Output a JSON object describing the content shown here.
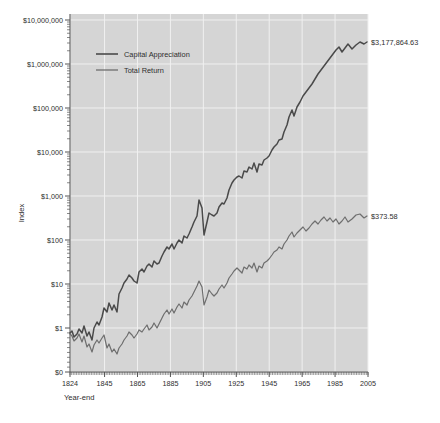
{
  "chart_data": {
    "type": "line",
    "title": "",
    "subtitle": "",
    "xlabel": "Year-end",
    "ylabel": "Index",
    "yscale": "log",
    "grid": true,
    "legend_position": "top-left",
    "xlim": [
      1824,
      2005
    ],
    "ylim_labels": [
      "$0",
      "$1",
      "$10",
      "$100",
      "$1,000",
      "$10,000",
      "$100,000",
      "$1,000,000",
      "$10,000,000"
    ],
    "ytick_labels": [
      "$10,000,000",
      "$1,000,000",
      "$100,000",
      "$10,000",
      "$1,000",
      "$100",
      "$10",
      "$1",
      "$0"
    ],
    "ytick_values": [
      10000000,
      1000000,
      100000,
      10000,
      1000,
      100,
      10,
      1,
      0
    ],
    "xtick_labels": [
      "1824",
      "1845",
      "1865",
      "1885",
      "1905",
      "1925",
      "1945",
      "1965",
      "1985",
      "2005"
    ],
    "xtick_values": [
      1824,
      1845,
      1865,
      1885,
      1905,
      1925,
      1945,
      1965,
      1985,
      2005
    ],
    "annotations": [
      {
        "name": "capital-appreciation-end-value",
        "text": "$3,177,864.63",
        "x": 2005,
        "y": 3177864.63
      },
      {
        "name": "total-return-end-value",
        "text": "$373.58",
        "x": 2005,
        "y": 373.58
      }
    ],
    "series": [
      {
        "name": "Capital Appreciation",
        "color": "#4a4a4a",
        "width": 1.5,
        "x": [
          1824,
          1826,
          1828,
          1830,
          1832,
          1834,
          1836,
          1838,
          1840,
          1842,
          1844,
          1846,
          1848,
          1850,
          1852,
          1854,
          1856,
          1858,
          1860,
          1862,
          1864,
          1866,
          1868,
          1870,
          1872,
          1874,
          1876,
          1878,
          1880,
          1882,
          1884,
          1886,
          1888,
          1890,
          1892,
          1894,
          1896,
          1898,
          1900,
          1902,
          1904,
          1906,
          1908,
          1910,
          1912,
          1914,
          1916,
          1918,
          1920,
          1922,
          1924,
          1926,
          1928,
          1930,
          1932,
          1934,
          1936,
          1938,
          1940,
          1942,
          1944,
          1946,
          1948,
          1950,
          1952,
          1954,
          1956,
          1958,
          1960,
          1962,
          1964,
          1966,
          1968,
          1970,
          1972,
          1974,
          1976,
          1978,
          1980,
          1982,
          1984,
          1986,
          1988,
          1990,
          1992,
          1994,
          1996,
          1998,
          2000,
          2002,
          2004,
          2005
        ],
        "y": [
          1.0,
          1.05,
          0.97,
          1.02,
          1.12,
          1.05,
          1.18,
          0.98,
          1.05,
          0.92,
          1.15,
          1.3,
          1.22,
          1.45,
          1.75,
          1.62,
          1.95,
          1.7,
          1.88,
          1.65,
          2.35,
          2.8,
          3.2,
          3.6,
          4.1,
          3.8,
          3.55,
          3.4,
          4.6,
          5.1,
          4.7,
          5.6,
          5.9,
          5.5,
          6.4,
          6.0,
          6.1,
          7.4,
          8.2,
          9.6,
          9.1,
          10.5,
          9.0,
          10.8,
          11.9,
          10.9,
          13.5,
          12.8,
          14.5,
          18.5,
          22.0,
          27.0,
          46.0,
          35.0,
          16.0,
          24.0,
          33.0,
          30.0,
          29.0,
          32.0,
          40.0,
          46.0,
          44.0,
          55.0,
          70.0,
          92.0,
          105.0,
          118.0,
          122.0,
          112.0,
          152.0,
          148.0,
          178.0,
          165.0,
          215.0,
          145.0,
          205.0,
          195.0,
          250.0,
          270.0,
          295.0,
          400.0,
          450.0,
          520.0,
          620.0,
          660.0,
          920.0,
          1350.0,
          2100.0,
          1550.0,
          2350.0,
          3177864.63
        ]
      },
      {
        "name": "Total Return",
        "color": "#6e6e6e",
        "width": 1.2,
        "x": [
          1824,
          1826,
          1828,
          1830,
          1832,
          1834,
          1836,
          1838,
          1840,
          1842,
          1844,
          1846,
          1848,
          1850,
          1852,
          1854,
          1856,
          1858,
          1860,
          1862,
          1864,
          1866,
          1868,
          1870,
          1872,
          1874,
          1876,
          1878,
          1880,
          1882,
          1884,
          1886,
          1888,
          1890,
          1892,
          1894,
          1896,
          1898,
          1900,
          1902,
          1904,
          1906,
          1908,
          1910,
          1912,
          1914,
          1916,
          1918,
          1920,
          1922,
          1924,
          1926,
          1928,
          1930,
          1932,
          1934,
          1936,
          1938,
          1940,
          1942,
          1944,
          1946,
          1948,
          1950,
          1952,
          1954,
          1956,
          1958,
          1960,
          1962,
          1964,
          1966,
          1968,
          1970,
          1972,
          1974,
          1976,
          1978,
          1980,
          1982,
          1984,
          1986,
          1988,
          1990,
          1992,
          1994,
          1996,
          1998,
          2000,
          2002,
          2004,
          2005
        ],
        "y": [
          1.0,
          1.04,
          0.95,
          1.0,
          1.1,
          1.02,
          1.15,
          0.95,
          1.0,
          0.9,
          1.12,
          1.28,
          1.2,
          1.4,
          1.7,
          1.58,
          1.9,
          1.68,
          1.85,
          1.62,
          2.3,
          2.75,
          3.15,
          3.55,
          4.0,
          3.75,
          3.5,
          3.35,
          4.55,
          5.05,
          4.65,
          5.55,
          5.85,
          5.45,
          6.35,
          5.95,
          6.05,
          7.35,
          8.1,
          9.5,
          9.0,
          10.4,
          8.9,
          10.7,
          11.8,
          10.8,
          13.4,
          12.7,
          14.4,
          18.4,
          21.8,
          26.8,
          45.5,
          34.5,
          15.8,
          23.8,
          32.5,
          29.5,
          28.5,
          31.5,
          39.5,
          45.5,
          43.5,
          54.0,
          69.0,
          91.0,
          104.0,
          117.0,
          121.0,
          111.0,
          151.0,
          147.0,
          177.0,
          164.0,
          214.0,
          144.0,
          204.0,
          194.0,
          249.0,
          269.0,
          294.0,
          373.58,
          373.58,
          373.58,
          373.58,
          373.58,
          373.58,
          373.58,
          373.58,
          373.58,
          373.58,
          373.58
        ]
      }
    ],
    "capital_appreciation_path": "M 70,333 L 72,331 L 74,337 L 77,334 L 79,329 L 82,333 L 84,326 L 87,336 L 89,332 L 92,340 L 94,328 L 97,322 L 99,325 L 102,317 L 104,308 L 107,312 L 109,303 L 112,310 L 114,305 L 117,312 L 119,294 L 122,288 L 124,283 L 127,279 L 129,275 L 132,278 L 134,281 L 137,283 L 139,272 L 142,269 L 144,272 L 147,266 L 149,264 L 152,267 L 154,261 L 157,264 L 159,263 L 162,256 L 164,252 L 167,247 L 169,249 L 172,244 L 174,249 L 177,243 L 179,240 L 182,243 L 184,236 L 187,238 L 189,234 L 192,227 L 194,222 L 197,216 L 199,200 L 202,208 L 204,235 L 207,222 L 209,213 L 212,215 L 214,216 L 217,213 L 219,207 L 222,203 L 224,204 L 227,198 L 229,190 L 232,183 L 234,180 L 237,177 L 239,176 L 242,178 L 244,171 L 247,172 L 249,167 L 252,169 L 254,163 L 257,172 L 259,164 L 262,165 L 264,160 L 267,158 L 269,156 L 272,150 L 274,147 L 277,144 L 279,140 L 282,139 L 284,132 L 287,125 L 289,117 L 292,110 L 294,116 L 297,107 L 300,102 L 303,96 L 306,92 L 309,88 L 312,84 L 315,79 L 318,74 L 321,70 L 324,66 L 327,62 L 330,58 L 333,54 L 336,50 L 339,47 L 342,52 L 345,48 L 348,44 L 352,49 L 356,45 L 360,42 L 364,44 L 367,42",
    "total_return_path": "M 70,334 L 72,336 L 74,341 L 77,338 L 79,334 L 82,342 L 84,336 L 87,347 L 89,344 L 92,352 L 94,345 L 97,340 L 99,343 L 102,338 L 104,335 L 107,348 L 109,344 L 112,352 L 114,349 L 117,354 L 119,348 L 122,344 L 124,340 L 127,336 L 129,332 L 132,335 L 134,338 L 137,334 L 139,330 L 142,332 L 144,329 L 147,325 L 149,330 L 152,327 L 154,323 L 157,328 L 159,324 L 162,318 L 164,314 L 167,310 L 169,314 L 172,309 L 174,313 L 177,307 L 179,304 L 182,308 L 184,302 L 187,305 L 189,300 L 192,296 L 194,292 L 197,286 L 199,281 L 202,287 L 204,305 L 207,297 L 209,290 L 212,294 L 214,296 L 217,293 L 219,289 L 222,285 L 224,288 L 227,283 L 229,278 L 232,274 L 234,271 L 237,268 L 239,270 L 242,273 L 244,267 L 247,269 L 249,265 L 252,268 L 254,263 L 257,272 L 259,266 L 262,268 L 264,263 L 267,261 L 269,259 L 272,255 L 274,252 L 277,250 L 279,247 L 282,249 L 284,244 L 287,240 L 289,236 L 292,232 L 294,237 L 297,233 L 300,230 L 303,227 L 306,231 L 309,228 L 312,224 L 315,221 L 318,224 L 321,220 L 324,217 L 327,221 L 330,218 L 333,222 L 336,219 L 339,224 L 342,221 L 345,217 L 348,222 L 352,219 L 356,215 L 360,214 L 364,218 L 367,216"
  },
  "legend": {
    "items": [
      {
        "label": "Capital Appreciation",
        "color": "#4a4a4a"
      },
      {
        "label": "Total Return",
        "color": "#6e6e6e"
      }
    ]
  },
  "axes": {
    "y_title": "Index",
    "x_title": "Year-end"
  },
  "colors": {
    "plot_background": "#d5d5d5",
    "gridline": "#f0f0f0",
    "axis": "#555555",
    "text": "#2e2e2e",
    "page_background": "#ffffff",
    "capital_appreciation": "#4a4a4a",
    "total_return": "#6e6e6e"
  }
}
